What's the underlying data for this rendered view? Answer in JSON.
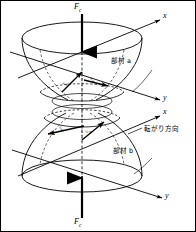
{
  "figure": {
    "border_color": "#000000",
    "line_color": "#000000",
    "background": "#ffffff"
  },
  "forces": {
    "top": {
      "symbol": "F",
      "subscript": "c",
      "direction": "downward"
    },
    "bottom": {
      "symbol": "F",
      "subscript": "c",
      "direction": "upward"
    }
  },
  "axes": {
    "upper": {
      "x_label": "x",
      "y_label": "y"
    },
    "lower": {
      "x_label": "x",
      "y_label": "y"
    }
  },
  "members": {
    "upper": {
      "label": "部材 a"
    },
    "lower": {
      "label": "部材 b"
    }
  },
  "annotations": {
    "rolling_direction": "転がり方向"
  },
  "vectors": [
    {
      "id": "v-ax",
      "symbol": "v",
      "subscript": "ax",
      "member": "a"
    },
    {
      "id": "v-ay",
      "symbol": "v",
      "subscript": "ay",
      "member": "a"
    },
    {
      "id": "v-bx",
      "symbol": "v",
      "subscript": "bx",
      "member": "b"
    },
    {
      "id": "v-by",
      "symbol": "v",
      "subscript": "by",
      "member": "b"
    }
  ]
}
